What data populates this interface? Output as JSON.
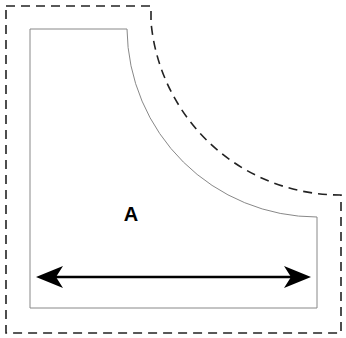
{
  "diagram": {
    "region_label": "A",
    "colors": {
      "background": "#ffffff",
      "inner_outline": "#888888",
      "outer_dashed": "#222222",
      "arrow": "#000000",
      "label": "#000000"
    },
    "shapes": {
      "outer_dashed_boundary": "offset outline around inner shape",
      "inner_shape": "rectangle with concave quarter-circle cutout at top-right",
      "dimension_arrow": "double-headed horizontal arrow across bottom width"
    }
  }
}
